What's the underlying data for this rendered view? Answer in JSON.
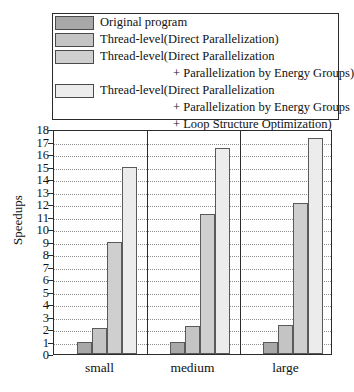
{
  "chart_data": {
    "type": "bar",
    "title": "",
    "xlabel": "",
    "ylabel": "Speedups",
    "categories": [
      "small",
      "medium",
      "large"
    ],
    "ylim": [
      0,
      18
    ],
    "ytick_labels": [
      "0",
      "1",
      "2",
      "3",
      "4",
      "5",
      "6",
      "7",
      "8",
      "9",
      "10",
      "11",
      "12",
      "13",
      "14",
      "15",
      "16",
      "17",
      "18"
    ],
    "grid": true,
    "legend_position": "top",
    "series": [
      {
        "name": "Original program",
        "color": "#a8a8a8",
        "values": [
          1.0,
          1.0,
          1.0
        ]
      },
      {
        "name": "Thread-level(Direct Parallelization)",
        "color": "#c4c4c4",
        "values": [
          2.05,
          2.25,
          2.3
        ]
      },
      {
        "name": "Thread-level(Direct Parallelization + Parallelization by Energy Groups)",
        "color": "#cfcfcf",
        "values": [
          9.0,
          11.2,
          12.1
        ]
      },
      {
        "name": "Thread-level(Direct Parallelization + Parallelization by Energy Groups + Loop Structure Optimization)",
        "color": "#ececec",
        "values": [
          15.0,
          16.5,
          17.3
        ]
      }
    ]
  },
  "legend": {
    "entries": [
      {
        "swatch_color": "#a8a8a8",
        "line1": "Original program",
        "line2": "",
        "line3": ""
      },
      {
        "swatch_color": "#c4c4c4",
        "line1": "Thread-level(Direct Parallelization)",
        "line2": "",
        "line3": ""
      },
      {
        "swatch_color": "#cfcfcf",
        "line1": "Thread-level(Direct Parallelization",
        "line2": "+ Parallelization by Energy Groups)",
        "line3": ""
      },
      {
        "swatch_color": "#ececec",
        "line1": "Thread-level(Direct Parallelization",
        "line2": "+ Parallelization by Energy Groups",
        "line3": "+ Loop Structure Optimization)"
      }
    ]
  },
  "axes": {
    "y_label": "Speedups",
    "y_ticks": [
      "18",
      "17",
      "16",
      "15",
      "14",
      "13",
      "12",
      "11",
      "10",
      "9",
      "8",
      "7",
      "6",
      "5",
      "4",
      "3",
      "2",
      "1",
      "0"
    ],
    "x_ticks": [
      "small",
      "medium",
      "large"
    ]
  },
  "colors": {
    "axis": "#2b2b2b",
    "grid": "#8f8f8f",
    "bar_edge": "#5a5a5a",
    "background": "#ffffff"
  }
}
